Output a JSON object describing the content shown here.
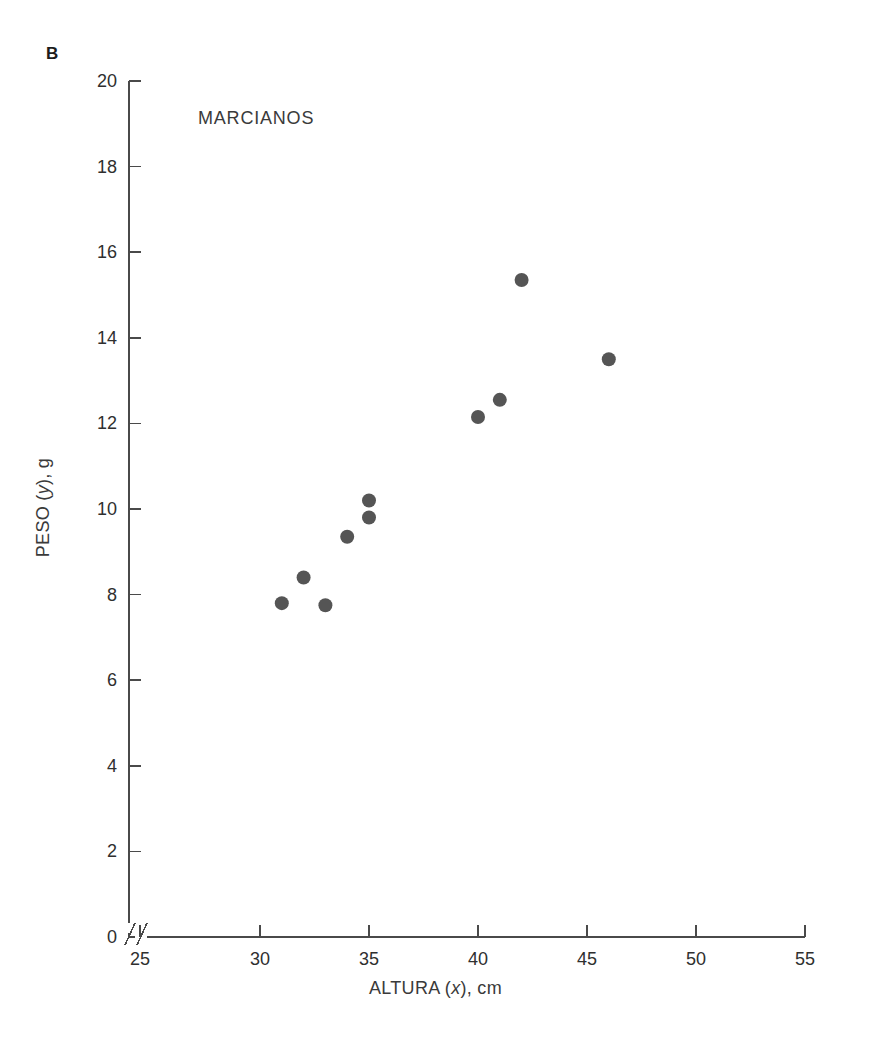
{
  "figure": {
    "panel_letter": "B",
    "background_color": "#ffffff",
    "axis_color": "#4a4a4a",
    "text_color": "#2f2f2f"
  },
  "chart_data": {
    "type": "scatter",
    "title": "MARCIANOS",
    "xlabel": "ALTURA (x), cm",
    "xlabel_parts": {
      "prefix": "ALTURA (",
      "italic": "x",
      "suffix": "), cm"
    },
    "ylabel": "PESO (y), g",
    "ylabel_parts": {
      "prefix": "PESO (",
      "italic": "y",
      "suffix": "), g"
    },
    "xlim": [
      25,
      55
    ],
    "ylim": [
      0,
      20
    ],
    "xticks": [
      25,
      30,
      35,
      40,
      45,
      50,
      55
    ],
    "yticks": [
      0,
      2,
      4,
      6,
      8,
      10,
      12,
      14,
      16,
      18,
      20
    ],
    "xtick_labels": [
      "25",
      "30",
      "35",
      "40",
      "45",
      "50",
      "55"
    ],
    "ytick_labels": [
      "0",
      "2",
      "4",
      "6",
      "8",
      "10",
      "12",
      "14",
      "16",
      "18",
      "20"
    ],
    "grid": false,
    "legend": null,
    "axis_break_x": true,
    "axis_break_y": true,
    "marker_color": "#555555",
    "marker_size": 7,
    "x": [
      31,
      32,
      33,
      34,
      35,
      35,
      40,
      41,
      42,
      46
    ],
    "y": [
      7.8,
      8.4,
      7.75,
      9.35,
      10.2,
      9.8,
      12.15,
      12.55,
      15.35,
      13.5
    ],
    "points": [
      {
        "x": 31,
        "y": 7.8
      },
      {
        "x": 32,
        "y": 8.4
      },
      {
        "x": 33,
        "y": 7.75
      },
      {
        "x": 34,
        "y": 9.35
      },
      {
        "x": 35,
        "y": 10.2
      },
      {
        "x": 35,
        "y": 9.8
      },
      {
        "x": 40,
        "y": 12.15
      },
      {
        "x": 41,
        "y": 12.55
      },
      {
        "x": 42,
        "y": 15.35
      },
      {
        "x": 46,
        "y": 13.5
      }
    ]
  }
}
